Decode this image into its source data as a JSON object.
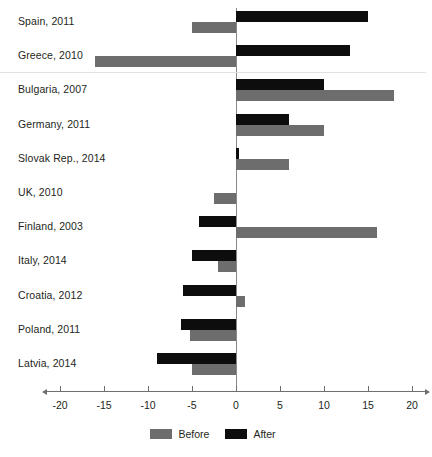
{
  "chart_data": {
    "type": "bar",
    "orientation": "horizontal",
    "title": "",
    "subtitle": "",
    "xlabel": "",
    "ylabel": "",
    "xlim": [
      -21.5,
      21.5
    ],
    "grid": false,
    "legend_position": "bottom-center",
    "categories": [
      "Spain, 2011",
      "Greece, 2010",
      "Bulgaria, 2007",
      "Germany, 2011",
      "Slovak Rep., 2014",
      "UK, 2010",
      "Finland, 2003",
      "Italy, 2014",
      "Croatia, 2012",
      "Poland, 2011",
      "Latvia, 2014"
    ],
    "series": [
      {
        "name": "Before",
        "color": "#6d6d6d",
        "values": [
          -5,
          -16,
          18,
          10,
          6,
          -2.5,
          16,
          -2,
          1,
          -5.2,
          -5
        ]
      },
      {
        "name": "After",
        "color": "#0d0d0d",
        "values": [
          15,
          13,
          10,
          6,
          0.3,
          0,
          -4.2,
          -5,
          -6,
          -6.2,
          -9
        ]
      }
    ],
    "xticks": [
      -20,
      -15,
      -10,
      -5,
      0,
      5,
      10,
      15,
      20
    ],
    "xtick_labels": [
      "-20",
      "-15",
      "-10",
      "-5",
      "0",
      "5",
      "10",
      "15",
      "20"
    ],
    "group_separator_after_category_index": 1
  },
  "legend": {
    "items": [
      {
        "label": "Before",
        "swatch": "before"
      },
      {
        "label": "After",
        "swatch": "after"
      }
    ]
  }
}
